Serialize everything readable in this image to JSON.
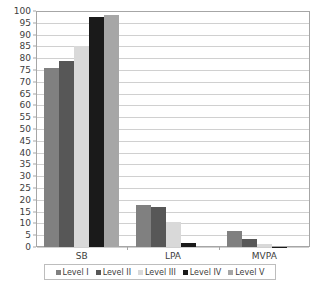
{
  "chart_data": {
    "type": "bar",
    "title": "",
    "subtitle": "",
    "xlabel": "",
    "ylabel": "",
    "categories": [
      "SB",
      "LPA",
      "MVPA"
    ],
    "series": [
      {
        "name": "Level I",
        "color": "#808080",
        "values": [
          76.0,
          17.8,
          6.6
        ]
      },
      {
        "name": "Level II",
        "color": "#575757",
        "values": [
          79.0,
          16.8,
          3.5
        ]
      },
      {
        "name": "Level III",
        "color": "#d9d9d9",
        "values": [
          85.0,
          10.5,
          1.2
        ]
      },
      {
        "name": "Level IV",
        "color": "#1a1a1a",
        "values": [
          97.5,
          1.6,
          0.15
        ]
      },
      {
        "name": "Level V",
        "color": "#a6a6a6",
        "values": [
          98.5,
          0.5,
          0.0
        ]
      }
    ],
    "ylim": [
      0,
      100
    ],
    "ytick_step": 5,
    "yticks": [
      0,
      5,
      10,
      15,
      20,
      25,
      30,
      35,
      40,
      45,
      50,
      55,
      60,
      65,
      70,
      75,
      80,
      85,
      90,
      95,
      100
    ],
    "ytick_labels": [
      "0",
      "5",
      "10",
      "15",
      "20",
      "25",
      "30",
      "35",
      "40",
      "45",
      "50",
      "55",
      "60",
      "65",
      "70",
      "75",
      "80",
      "85",
      "90",
      "95",
      "100"
    ],
    "grid": true,
    "grid_axis": "y",
    "legend_position": "bottom",
    "legend_entries": [
      "Level I",
      "Level II",
      "Level III",
      "Level IV",
      "Level V"
    ],
    "bar_gap_group": true,
    "colors": {
      "grid": "#d0d0d0",
      "axis": "#a6a6a6",
      "text": "#3d3d3d",
      "background": "#ffffff"
    }
  }
}
